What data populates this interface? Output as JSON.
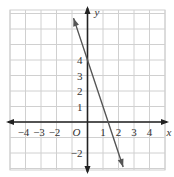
{
  "chart_data": {
    "type": "line",
    "title": "",
    "xlabel": "x",
    "ylabel": "y",
    "origin_label": "O",
    "xlim": [
      -5,
      5
    ],
    "ylim": [
      -3,
      7
    ],
    "grid": true,
    "x_ticks": [
      -4,
      -3,
      -2,
      1,
      2,
      3,
      4
    ],
    "x_tick_labels": [
      "−4",
      "−3",
      "−2",
      "1",
      "2",
      "3",
      "4"
    ],
    "y_ticks": [
      4,
      3,
      2,
      1,
      -2
    ],
    "y_tick_labels": [
      "4",
      "3",
      "2",
      "1",
      "−2"
    ],
    "series": [
      {
        "name": "y = -3x + 4",
        "slope": -3,
        "intercept": 4,
        "x": [
          -0.9,
          2.3
        ],
        "y": [
          6.7,
          -2.9
        ]
      }
    ],
    "colors": {
      "grid": "#d0d0d0",
      "axis": "#222222",
      "line": "#555555"
    }
  }
}
